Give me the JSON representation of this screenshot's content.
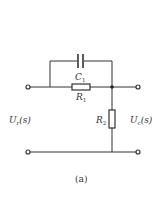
{
  "figure": {
    "caption": "(a)",
    "type": "circuit-schematic"
  },
  "components": {
    "c1": {
      "symbol": "C",
      "subscript": "1",
      "kind": "capacitor"
    },
    "r1": {
      "symbol": "R",
      "subscript": "1",
      "kind": "resistor"
    },
    "r2": {
      "symbol": "R",
      "subscript": "2",
      "kind": "resistor"
    }
  },
  "ports": {
    "input": {
      "symbol": "U",
      "subscript": "r",
      "arg": "(s)"
    },
    "output": {
      "symbol": "U",
      "subscript": "c",
      "arg": "(s)"
    }
  },
  "colors": {
    "wire": "#333333",
    "background": "#ffffff"
  }
}
